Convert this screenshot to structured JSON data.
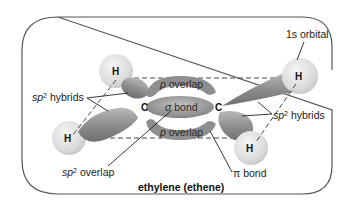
{
  "title": "ethylene (ethene)",
  "atoms": {
    "carbon": "C",
    "hydrogen": "H"
  },
  "labels": {
    "p_overlap": "p",
    "overlap_word": " overlap",
    "sigma_symbol": "σ",
    "bond_word": " bond",
    "pi_symbol": "π",
    "sp": "sp",
    "sup2": "2",
    "hybrids_word": " hybrids",
    "one_s_orbital": "1s orbital"
  },
  "colors": {
    "lobe": "#9a9a9a",
    "lobe_dark": "#6f6f6f",
    "hydrogen": "#e2e2e2",
    "frame": "#555555"
  }
}
